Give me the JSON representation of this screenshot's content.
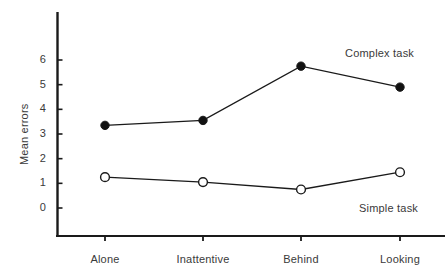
{
  "chart_data": {
    "type": "line",
    "title": "",
    "xlabel": "",
    "ylabel": "Mean errors",
    "categories": [
      "Alone",
      "Inattentive",
      "Behind",
      "Looking"
    ],
    "yticks": [
      0,
      1,
      2,
      3,
      4,
      5,
      6
    ],
    "ylim": [
      0,
      6.9
    ],
    "grid": false,
    "legend_position": "inline-annotation",
    "series": [
      {
        "name": "Complex task",
        "marker": "filled-circle",
        "values": [
          3.35,
          3.55,
          5.75,
          4.9
        ]
      },
      {
        "name": "Simple task",
        "marker": "open-circle",
        "values": [
          1.25,
          1.05,
          0.75,
          1.45
        ]
      }
    ],
    "annotations": [
      {
        "text": "Complex task",
        "x": 345,
        "y": 47
      },
      {
        "text": "Simple task",
        "x": 359,
        "y": 202
      }
    ],
    "colors": {
      "axis": "#1a1a1a",
      "line": "#1a1a1a",
      "filled_marker": "#111111",
      "open_marker_fill": "#ffffff",
      "text": "#3a3a3a",
      "background": "#ffffff"
    }
  }
}
